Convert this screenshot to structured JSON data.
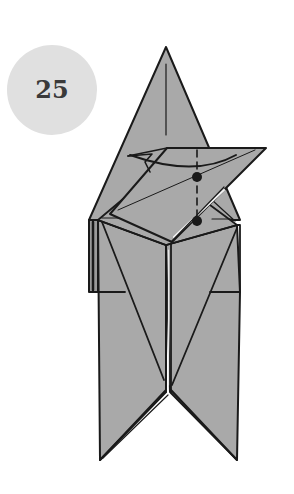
{
  "step": {
    "number": "25",
    "badge_color": "#e0e0e0"
  },
  "diagram": {
    "paper_color": "#a9a9a9",
    "line_color": "#1a1a1a",
    "markers": [
      "valley-fold-dashed-line",
      "pivot-dot-upper",
      "pivot-dot-lower",
      "fold-arrow-curve"
    ]
  }
}
